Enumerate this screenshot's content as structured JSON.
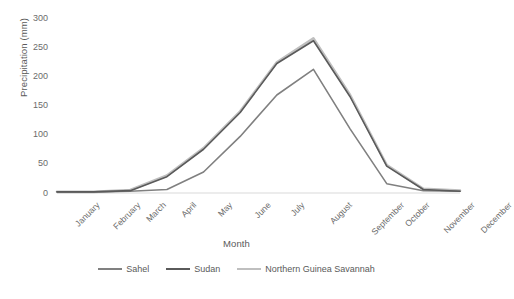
{
  "chart_data": {
    "type": "line",
    "title": "",
    "xlabel": "Month",
    "ylabel": "Precipitation (mm)",
    "categories": [
      "January",
      "February",
      "March",
      "April",
      "May",
      "June",
      "July",
      "August",
      "September",
      "October",
      "November",
      "December"
    ],
    "ylim": [
      0,
      300
    ],
    "yticks": [
      0,
      50,
      100,
      150,
      200,
      250,
      300
    ],
    "grid": false,
    "legend_position": "bottom",
    "series": [
      {
        "name": "Sahel",
        "color": "#808080",
        "values": [
          2,
          2,
          3,
          6,
          36,
          97,
          168,
          212,
          110,
          16,
          4,
          3
        ]
      },
      {
        "name": "Sudan",
        "color": "#5a5a5a",
        "values": [
          2,
          2,
          4,
          28,
          75,
          138,
          222,
          261,
          165,
          46,
          6,
          3
        ]
      },
      {
        "name": "Northern Guinea Savannah",
        "color": "#bfbfbf",
        "values": [
          2,
          2,
          5,
          30,
          77,
          140,
          224,
          265,
          168,
          48,
          7,
          4
        ]
      }
    ]
  },
  "axis": {
    "y_title": "Precipitation (mm)",
    "x_title": "Month",
    "y_tick_labels": [
      "300",
      "250",
      "200",
      "150",
      "100",
      "50",
      "0"
    ],
    "x_tick_labels": [
      "January",
      "February",
      "March",
      "April",
      "May",
      "June",
      "July",
      "August",
      "September",
      "October",
      "November",
      "December"
    ]
  },
  "legend": {
    "items": [
      {
        "label": "Sahel",
        "color": "#808080"
      },
      {
        "label": "Sudan",
        "color": "#5a5a5a"
      },
      {
        "label": "Northern Guinea Savannah",
        "color": "#bfbfbf"
      }
    ]
  }
}
